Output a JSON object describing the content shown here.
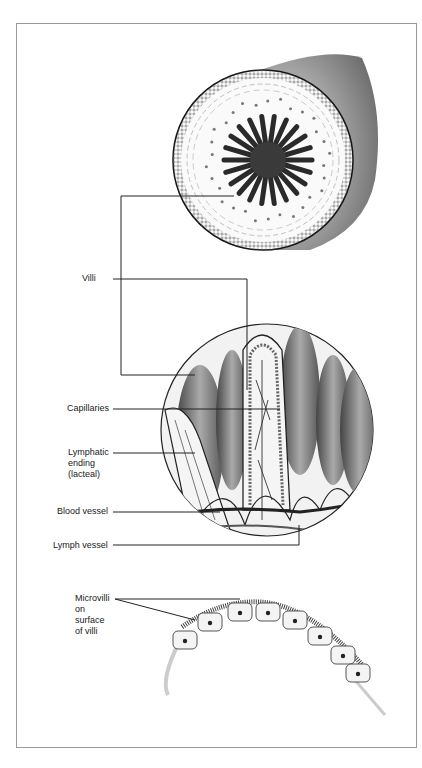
{
  "figure": {
    "labels": {
      "villi": "Villi",
      "capillaries": "Capillaries",
      "lacteal": "Lymphatic\nending\n(lacteal)",
      "blood_vessel": "Blood vessel",
      "lymph_vessel": "Lymph vessel",
      "microvilli": "Microvilli\non\nsurface\nof villi"
    },
    "colors": {
      "ink": "#1a1a1a",
      "frame": "#9a9a9a",
      "shade": "#7a7a7a"
    }
  }
}
